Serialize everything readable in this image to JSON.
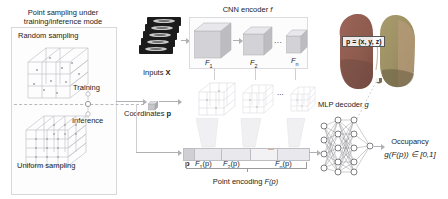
{
  "figure": {
    "domain": "diagram"
  },
  "left_panel": {
    "title_line1": "Point sampling under",
    "title_line2": "training/inference mode",
    "random_sampling_label": "Random sampling",
    "uniform_sampling_label": "Uniform sampling",
    "training_label": "Training",
    "inference_label": "Inference",
    "toggle_state": "training"
  },
  "inputs": {
    "label": "Inputs",
    "symbol": "X",
    "slice_count": 5
  },
  "encoder": {
    "title": "CNN encoder",
    "symbol": "f",
    "features": [
      {
        "label": "F",
        "sub": "1"
      },
      {
        "label": "F",
        "sub": "2"
      },
      {
        "label": "F",
        "sub": "n"
      }
    ],
    "ellipsis": "..."
  },
  "coordinates": {
    "label": "Coordinates",
    "symbol": "p"
  },
  "point_encoding": {
    "caption_prefix": "Point encoding",
    "caption_symbol": "F(p)",
    "segments": [
      {
        "label": "p"
      },
      {
        "label": "F",
        "sub": "1",
        "suffix": "(p)"
      },
      {
        "label": "F",
        "sub": "2",
        "suffix": "(p)"
      },
      {
        "label": "...",
        "sub": "",
        "suffix": ""
      },
      {
        "label": "F",
        "sub": "n",
        "suffix": "(p)"
      }
    ],
    "ellipsis": "..."
  },
  "decoder": {
    "title": "MLP decoder",
    "symbol": "g",
    "layer_sizes": [
      4,
      5,
      5,
      5,
      1
    ]
  },
  "output": {
    "title": "Occupancy",
    "formula": "g(F(p)) ∈ [0,1]"
  },
  "lung": {
    "coordinate_equation": "p = (x, y, z)",
    "colors": {
      "left_lobe": "#8d5a4e",
      "right_lobe": "#9c8f63",
      "highlight": "#b89a7a",
      "dark": "#6f4a42"
    }
  },
  "colors": {
    "panel_border": "#d8d8dc",
    "arrow": "#b0b0b4",
    "cube_face": "#d5d5d9",
    "cube_top": "#e6e6ea",
    "cube_side": "#b9b9be",
    "bar_fill": "#e9e9ed",
    "text": "#1c1c1c"
  }
}
